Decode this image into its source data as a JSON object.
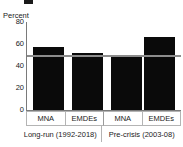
{
  "chart_data": {
    "type": "bar",
    "title": "",
    "subtitle": "",
    "xlabel": "",
    "ylabel": "Percent",
    "ylim": [
      0,
      80
    ],
    "yticks": [
      "0",
      "20",
      "40",
      "60",
      "80"
    ],
    "ytick_values": [
      0,
      20,
      40,
      60,
      80
    ],
    "grid": false,
    "legend": "none",
    "categories": [
      "MNA",
      "EMDEs",
      "MNA",
      "EMDEs"
    ],
    "values": [
      57,
      52,
      50,
      66
    ],
    "groups": [
      {
        "label": "Long-run (1992-2018)",
        "categories": [
          "MNA",
          "EMDEs"
        ],
        "values": [
          57,
          52
        ]
      },
      {
        "label": "Pre-crisis (2003-08)",
        "categories": [
          "MNA",
          "EMDEs"
        ],
        "values": [
          50,
          66
        ]
      }
    ],
    "bar_color": "#0a0a0a",
    "reference_line": {
      "label": "",
      "value": 50,
      "color": "#8c8c8c"
    },
    "annotations": []
  },
  "axis": {
    "y_label": "Percent",
    "ticks": [
      {
        "label": "80",
        "value": 80
      },
      {
        "label": "60",
        "value": 60
      },
      {
        "label": "40",
        "value": 40
      },
      {
        "label": "20",
        "value": 20
      },
      {
        "label": "0",
        "value": 0
      }
    ]
  },
  "category_labels": [
    "MNA",
    "EMDEs",
    "MNA",
    "EMDEs"
  ],
  "group_labels": [
    "Long-run (1992-2018)",
    "Pre-crisis (2003-08)"
  ],
  "colors": {
    "bar": "#0a0a0a",
    "reference_line": "#8c8c8c",
    "axis": "#7a7a7a",
    "grid_border": "#b4b4b4",
    "text": "#1a1a1a",
    "background": "#ffffff"
  }
}
